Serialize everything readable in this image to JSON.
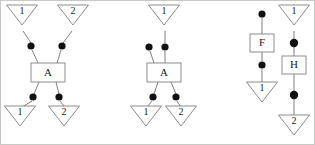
{
  "figure": {
    "background_color": "#ffffff",
    "line_color": "#707070",
    "shape_outline_color": "#808080",
    "dot_color": "#111111",
    "text_color": "#1a1a1a",
    "border_color": "#c8c8c8",
    "width": 315,
    "height": 145,
    "panel_count": 3
  },
  "panels": [
    {
      "id": "panel-1",
      "boxes": [
        {
          "id": "p1-box-a",
          "label": "A",
          "x": 30,
          "y": 62,
          "w": 34,
          "h": 19
        }
      ],
      "triangles": [
        {
          "id": "p1-tri-top-1",
          "label": "1",
          "cx": 21,
          "cy": 14,
          "w": 31,
          "h": 20,
          "orientation": "down"
        },
        {
          "id": "p1-tri-top-2",
          "label": "2",
          "cx": 72,
          "cy": 14,
          "w": 31,
          "h": 20,
          "orientation": "down"
        },
        {
          "id": "p1-tri-bottom-1",
          "label": "1",
          "cx": 19,
          "cy": 115,
          "w": 31,
          "h": 20,
          "orientation": "down"
        },
        {
          "id": "p1-tri-bottom-2",
          "label": "2",
          "cx": 63,
          "cy": 115,
          "w": 31,
          "h": 20,
          "orientation": "down"
        }
      ],
      "dots": [
        {
          "id": "p1-dot-in-left",
          "cx": 30,
          "cy": 45,
          "r": 3.6
        },
        {
          "id": "p1-dot-in-right",
          "cx": 61,
          "cy": 45,
          "r": 3.6
        },
        {
          "id": "p1-dot-out-left",
          "cx": 32,
          "cy": 96,
          "r": 3.6
        },
        {
          "id": "p1-dot-out-right",
          "cx": 58,
          "cy": 96,
          "r": 3.6
        }
      ],
      "edges": [
        {
          "id": "p1-edge-tri1-dot",
          "from": [
            22,
            30
          ],
          "to": [
            30,
            42
          ]
        },
        {
          "id": "p1-edge-tri2-dot",
          "from": [
            71,
            30
          ],
          "to": [
            62,
            42
          ]
        },
        {
          "id": "p1-edge-dotl-box",
          "from": [
            31,
            49
          ],
          "to": [
            37,
            62
          ]
        },
        {
          "id": "p1-edge-dotr-box",
          "from": [
            60,
            49
          ],
          "to": [
            56,
            62
          ]
        },
        {
          "id": "p1-edge-box-dotl",
          "from": [
            38,
            81
          ],
          "to": [
            33,
            93
          ]
        },
        {
          "id": "p1-edge-box-dotr",
          "from": [
            55,
            81
          ],
          "to": [
            58,
            93
          ]
        },
        {
          "id": "p1-edge-dotl-tri",
          "from": [
            31,
            100
          ],
          "to": [
            21,
            106
          ]
        },
        {
          "id": "p1-edge-dotr-tri",
          "from": [
            59,
            100
          ],
          "to": [
            64,
            106
          ]
        }
      ]
    },
    {
      "id": "panel-2",
      "boxes": [
        {
          "id": "p2-box-a",
          "label": "A",
          "x": 146,
          "y": 62,
          "w": 34,
          "h": 19
        }
      ],
      "triangles": [
        {
          "id": "p2-tri-top-1",
          "label": "1",
          "cx": 163,
          "cy": 14,
          "w": 31,
          "h": 20,
          "orientation": "down"
        },
        {
          "id": "p2-tri-bottom-1",
          "label": "1",
          "cx": 145,
          "cy": 115,
          "w": 31,
          "h": 20,
          "orientation": "down"
        },
        {
          "id": "p2-tri-bottom-2",
          "label": "2",
          "cx": 180,
          "cy": 115,
          "w": 31,
          "h": 20,
          "orientation": "down"
        }
      ],
      "dots": [
        {
          "id": "p2-dot-in-left",
          "cx": 148,
          "cy": 46,
          "r": 3.6
        },
        {
          "id": "p2-dot-in-right",
          "cx": 164,
          "cy": 46,
          "r": 3.6
        },
        {
          "id": "p2-dot-out-left",
          "cx": 152,
          "cy": 96,
          "r": 3.6
        },
        {
          "id": "p2-dot-out-right",
          "cx": 175,
          "cy": 96,
          "r": 3.6
        }
      ],
      "edges": [
        {
          "id": "p2-edge-tri1-dot",
          "from": [
            164,
            30
          ],
          "to": [
            164,
            42
          ]
        },
        {
          "id": "p2-edge-dotl-box",
          "from": [
            149,
            50
          ],
          "to": [
            153,
            62
          ]
        },
        {
          "id": "p2-edge-dotr-box",
          "from": [
            164,
            50
          ],
          "to": [
            164,
            62
          ]
        },
        {
          "id": "p2-edge-box-dotl",
          "from": [
            157,
            81
          ],
          "to": [
            153,
            93
          ]
        },
        {
          "id": "p2-edge-box-dotr",
          "from": [
            170,
            81
          ],
          "to": [
            175,
            93
          ]
        },
        {
          "id": "p2-edge-dotl-tri",
          "from": [
            151,
            100
          ],
          "to": [
            146,
            106
          ]
        },
        {
          "id": "p2-edge-dotr-tri",
          "from": [
            176,
            100
          ],
          "to": [
            180,
            106
          ]
        }
      ]
    },
    {
      "id": "panel-3",
      "boxes": [
        {
          "id": "p3-box-f",
          "label": "F",
          "x": 249,
          "y": 33,
          "w": 24,
          "h": 18
        },
        {
          "id": "p3-box-h",
          "label": "H",
          "x": 281,
          "y": 55,
          "w": 24,
          "h": 18
        }
      ],
      "triangles": [
        {
          "id": "p3-tri-right-top",
          "label": "1",
          "cx": 293,
          "cy": 14,
          "w": 31,
          "h": 20,
          "orientation": "down"
        },
        {
          "id": "p3-tri-left-bot",
          "label": "1",
          "cx": 261,
          "cy": 91,
          "w": 31,
          "h": 20,
          "orientation": "down"
        },
        {
          "id": "p3-tri-right-bot",
          "label": "2",
          "cx": 293,
          "cy": 124,
          "w": 31,
          "h": 20,
          "orientation": "down"
        }
      ],
      "dots": [
        {
          "id": "p3-dot-left-top",
          "cx": 261,
          "cy": 13,
          "r": 3.6
        },
        {
          "id": "p3-dot-left-middle",
          "cx": 261,
          "cy": 64,
          "r": 3.6
        },
        {
          "id": "p3-dot-right-upper",
          "cx": 293,
          "cy": 42,
          "r": 4.2
        },
        {
          "id": "p3-dot-right-lower",
          "cx": 293,
          "cy": 94,
          "r": 4.2
        }
      ],
      "edges": [
        {
          "id": "p3-edge-dot-f",
          "from": [
            261,
            17
          ],
          "to": [
            261,
            33
          ]
        },
        {
          "id": "p3-edge-f-dot",
          "from": [
            261,
            51
          ],
          "to": [
            261,
            60
          ]
        },
        {
          "id": "p3-edge-dot-tri",
          "from": [
            261,
            68
          ],
          "to": [
            261,
            82
          ]
        },
        {
          "id": "p3-edge-tri1-dot",
          "from": [
            293,
            30
          ],
          "to": [
            293,
            38
          ]
        },
        {
          "id": "p3-edge-dot-h",
          "from": [
            293,
            46
          ],
          "to": [
            293,
            55
          ]
        },
        {
          "id": "p3-edge-h-dot",
          "from": [
            293,
            73
          ],
          "to": [
            293,
            90
          ]
        },
        {
          "id": "p3-edge-dot-tri2",
          "from": [
            293,
            98
          ],
          "to": [
            293,
            115
          ]
        }
      ]
    }
  ]
}
